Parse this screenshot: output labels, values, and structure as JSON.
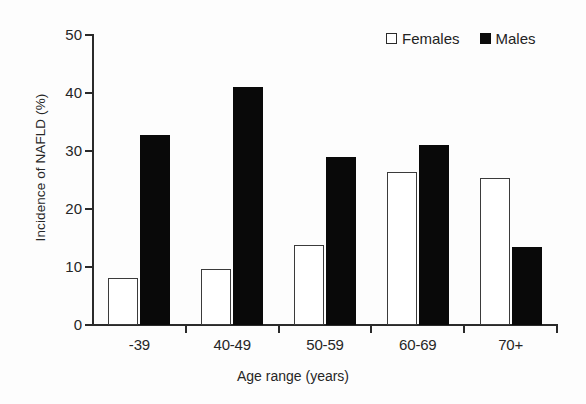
{
  "chart_data": {
    "type": "bar",
    "title": "",
    "subtitle": "",
    "xlabel": "Age range (years)",
    "ylabel": "Incidence of NAFLD (%)",
    "categories": [
      "-39",
      "40-49",
      "50-59",
      "60-69",
      "70+"
    ],
    "series": [
      {
        "name": "Females",
        "values": [
          8.1,
          9.6,
          13.8,
          26.3,
          25.3
        ],
        "style": "open-square",
        "color": "#ffffff",
        "edge_color": "#3b3b3b"
      },
      {
        "name": "Males",
        "values": [
          32.8,
          41.0,
          28.9,
          31.0,
          13.4
        ],
        "style": "filled-square",
        "color": "#090909",
        "edge_color": "#090909"
      }
    ],
    "ylim": [
      0,
      50
    ],
    "yticks": [
      0,
      10,
      20,
      30,
      40,
      50
    ],
    "ytick_labels": [
      "0",
      "10",
      "20",
      "30",
      "40",
      "50"
    ],
    "grid": false,
    "legend_position": "top-right",
    "legend_entries": [
      "Females",
      "Males"
    ],
    "annotations": []
  },
  "axes": {
    "y_title": "Incidence of NAFLD (%)",
    "x_title": "Age range (years)"
  },
  "legend": {
    "items": [
      {
        "label": "Females",
        "marker": "open-square-icon"
      },
      {
        "label": "Males",
        "marker": "filled-square-icon"
      }
    ]
  }
}
